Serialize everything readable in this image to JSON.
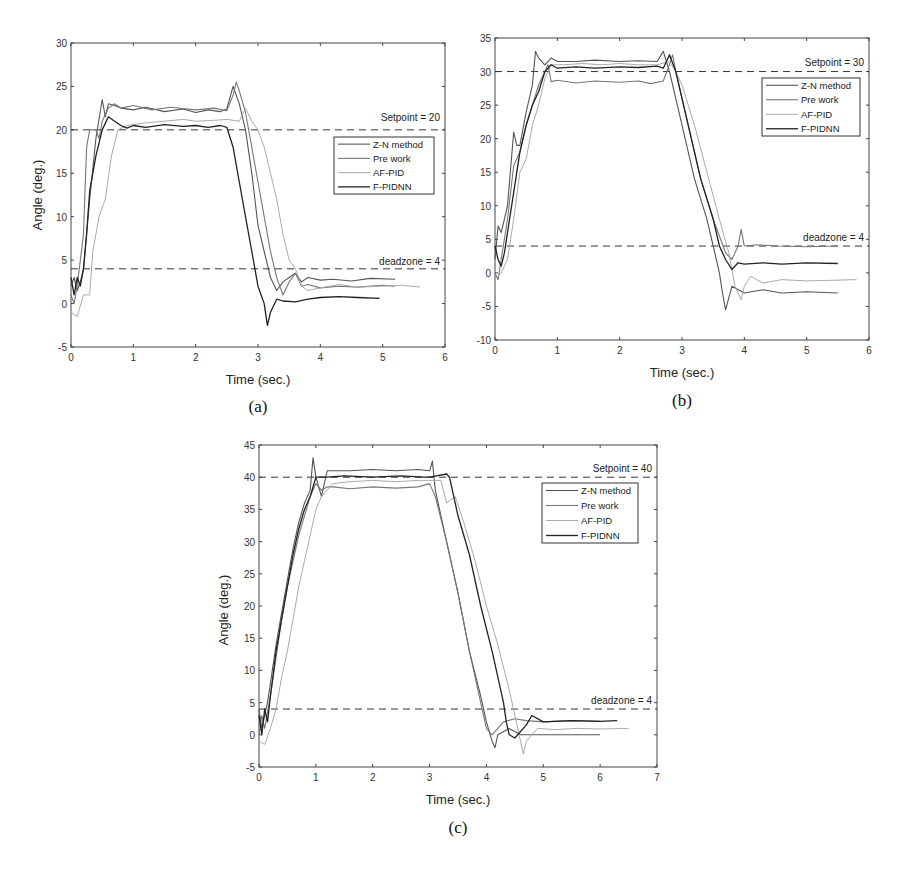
{
  "figure": {
    "panels": [
      "a",
      "b",
      "c"
    ]
  },
  "chart_data": [
    {
      "id": "a",
      "type": "line",
      "caption": "(a)",
      "xlabel": "Time (sec.)",
      "ylabel": "Angle (deg.)",
      "xlim": [
        0,
        6
      ],
      "ylim": [
        -5,
        30
      ],
      "xticks": [
        0,
        1,
        2,
        3,
        4,
        5,
        6
      ],
      "yticks": [
        -5,
        0,
        5,
        10,
        15,
        20,
        25,
        30
      ],
      "grid": false,
      "legend_position": "upper right (below setpoint line)",
      "annotations": [
        {
          "text": "Setpoint = 20",
          "y": 20,
          "style": "dashed"
        },
        {
          "text": "deadzone = 4",
          "y": 4,
          "style": "dashed"
        }
      ],
      "legend": [
        "Z-N method",
        "Pre work",
        "AF-PID",
        "F-PIDNN"
      ],
      "series": [
        {
          "name": "Z-N method",
          "color": "#555555",
          "width": 1.1,
          "x": [
            0,
            0.05,
            0.1,
            0.15,
            0.2,
            0.3,
            0.4,
            0.5,
            0.55,
            0.6,
            0.7,
            0.8,
            1.0,
            1.2,
            1.5,
            1.8,
            2.0,
            2.2,
            2.4,
            2.5,
            2.6,
            2.7,
            2.8,
            2.9,
            3.0,
            3.1,
            3.2,
            3.3,
            3.4,
            3.5,
            3.6,
            3.7,
            3.8,
            4.0,
            4.2,
            4.5,
            4.8,
            5.2
          ],
          "y": [
            2,
            3,
            1.5,
            2.5,
            4,
            12,
            19,
            23.5,
            21.5,
            23,
            22.8,
            22.5,
            22.3,
            22.6,
            22.1,
            22.4,
            22.0,
            22.3,
            22.1,
            22.4,
            25,
            23,
            20,
            15,
            9,
            6,
            3,
            1.5,
            2.5,
            3,
            3.5,
            2.5,
            3,
            2.7,
            2.8,
            2.6,
            2.9,
            2.8
          ]
        },
        {
          "name": "Pre work",
          "color": "#777777",
          "width": 1.1,
          "x": [
            0,
            0.05,
            0.1,
            0.2,
            0.25,
            0.3,
            0.4,
            0.45,
            0.5,
            0.6,
            0.7,
            0.8,
            1.0,
            1.3,
            1.6,
            2.0,
            2.3,
            2.5,
            2.6,
            2.65,
            2.7,
            2.8,
            2.9,
            3.0,
            3.1,
            3.2,
            3.3,
            3.4,
            3.5,
            3.6,
            3.7,
            3.8,
            4.0,
            4.3,
            4.6,
            5.0,
            5.2
          ],
          "y": [
            1,
            0,
            2,
            8,
            18,
            20,
            20,
            19,
            21,
            22.5,
            23,
            22.5,
            22.8,
            22.3,
            22.6,
            22.3,
            22.5,
            22.2,
            24,
            25.5,
            24.5,
            22,
            18,
            14,
            10,
            6,
            3,
            1,
            2.5,
            3.5,
            2,
            2.2,
            1.8,
            2.0,
            1.9,
            2.1,
            2.0
          ]
        },
        {
          "name": "AF-PID",
          "color": "#aaaaaa",
          "width": 1.0,
          "x": [
            0,
            0.1,
            0.2,
            0.3,
            0.35,
            0.45,
            0.55,
            0.65,
            0.75,
            0.9,
            1.2,
            1.5,
            1.8,
            2.0,
            2.3,
            2.5,
            2.7,
            2.8,
            2.9,
            3.0,
            3.1,
            3.2,
            3.3,
            3.4,
            3.5,
            3.6,
            3.7,
            3.8,
            4.0,
            4.3,
            4.6,
            5.0,
            5.3,
            5.6
          ],
          "y": [
            -1,
            -1.5,
            1,
            1,
            6,
            10,
            12,
            17,
            20,
            20.5,
            20.8,
            21,
            21.2,
            21,
            21.1,
            21.2,
            21,
            22.5,
            21,
            20,
            18,
            15,
            12,
            8,
            5,
            4,
            2,
            1.5,
            1.8,
            2.2,
            1.9,
            2.0,
            2.1,
            1.9
          ]
        },
        {
          "name": "F-PIDNN",
          "color": "#222222",
          "width": 1.3,
          "x": [
            0,
            0.05,
            0.1,
            0.15,
            0.2,
            0.25,
            0.3,
            0.4,
            0.5,
            0.6,
            0.7,
            0.8,
            0.9,
            1.0,
            1.2,
            1.5,
            1.8,
            2.0,
            2.2,
            2.4,
            2.5,
            2.6,
            2.7,
            2.8,
            2.9,
            3.0,
            3.1,
            3.15,
            3.2,
            3.3,
            3.4,
            3.6,
            3.8,
            4.0,
            4.3,
            4.6,
            4.95
          ],
          "y": [
            3,
            1,
            3,
            2,
            4,
            8,
            13,
            17,
            20,
            21.5,
            21,
            20.5,
            20.2,
            20.5,
            20.3,
            20.6,
            20.4,
            20.5,
            20.3,
            20.5,
            20.3,
            18,
            14,
            10,
            6,
            2,
            0,
            -2.5,
            -1,
            0.5,
            0.3,
            0.2,
            0.5,
            0.7,
            0.8,
            0.7,
            0.6
          ]
        }
      ]
    },
    {
      "id": "b",
      "type": "line",
      "caption": "(b)",
      "xlabel": "Time (sec.)",
      "ylabel": "",
      "xlim": [
        0,
        6
      ],
      "ylim": [
        -10,
        35
      ],
      "xticks": [
        0,
        1,
        2,
        3,
        4,
        5,
        6
      ],
      "yticks": [
        -10,
        -5,
        0,
        5,
        10,
        15,
        20,
        25,
        30,
        35
      ],
      "grid": false,
      "legend_position": "upper right (below setpoint line)",
      "annotations": [
        {
          "text": "Setpoint = 30",
          "y": 30,
          "style": "dashed"
        },
        {
          "text": "deadzone = 4",
          "y": 4,
          "style": "dashed"
        }
      ],
      "legend": [
        "Z-N method",
        "Pre work",
        "AF-PID",
        "F-PIDNN"
      ],
      "series": [
        {
          "name": "Z-N method",
          "color": "#555555",
          "width": 1.1,
          "x": [
            0,
            0.05,
            0.1,
            0.15,
            0.2,
            0.3,
            0.35,
            0.4,
            0.5,
            0.6,
            0.65,
            0.7,
            0.8,
            0.9,
            1.0,
            1.3,
            1.6,
            2.0,
            2.3,
            2.6,
            2.7,
            2.75,
            2.8,
            3.0,
            3.2,
            3.4,
            3.5,
            3.6,
            3.65,
            3.7,
            3.8,
            4.0,
            4.3,
            4.6,
            5.0,
            5.5
          ],
          "y": [
            2,
            7,
            6,
            8,
            10,
            21,
            19,
            19,
            24,
            28,
            33,
            32,
            31,
            32,
            31.5,
            31.5,
            31.7,
            31.5,
            31.6,
            31.5,
            33,
            31.5,
            30,
            22,
            14,
            8,
            4,
            0,
            -3,
            -5.5,
            -2,
            -3,
            -2.5,
            -3,
            -2.8,
            -3
          ]
        },
        {
          "name": "Pre work",
          "color": "#777777",
          "width": 1.1,
          "x": [
            0,
            0.05,
            0.1,
            0.2,
            0.3,
            0.4,
            0.5,
            0.6,
            0.7,
            0.8,
            0.85,
            0.9,
            1.0,
            1.3,
            1.6,
            2.0,
            2.3,
            2.5,
            2.7,
            2.8,
            2.85,
            2.9,
            3.1,
            3.3,
            3.5,
            3.7,
            3.8,
            3.9,
            3.95,
            4.0,
            4.2,
            4.5,
            5.0,
            5.5
          ],
          "y": [
            0,
            -1,
            2,
            8,
            16,
            18,
            22,
            25,
            28,
            30,
            31,
            28.5,
            28.7,
            28.3,
            28.6,
            28.4,
            28.6,
            28.2,
            28.6,
            31,
            32.5,
            30,
            22,
            14,
            8,
            3,
            2,
            4,
            6.5,
            4,
            4.2,
            4,
            3.9,
            4
          ]
        },
        {
          "name": "AF-PID",
          "color": "#aaaaaa",
          "width": 1.0,
          "x": [
            0,
            0.1,
            0.2,
            0.3,
            0.4,
            0.5,
            0.6,
            0.7,
            0.8,
            0.9,
            1.1,
            1.4,
            1.7,
            2.0,
            2.3,
            2.6,
            2.8,
            2.9,
            3.0,
            3.2,
            3.4,
            3.6,
            3.75,
            3.85,
            3.95,
            4.0,
            4.1,
            4.3,
            4.6,
            5.0,
            5.4,
            5.8
          ],
          "y": [
            -1,
            0,
            2,
            8,
            15,
            17,
            22,
            25,
            29,
            31,
            31,
            31.2,
            31,
            31.2,
            31,
            31,
            31.5,
            30,
            28,
            22,
            15,
            8,
            3,
            -2,
            -4,
            -2,
            -0.5,
            -1.5,
            -1,
            -1.2,
            -1.1,
            -1
          ]
        },
        {
          "name": "F-PIDNN",
          "color": "#222222",
          "width": 1.3,
          "x": [
            0,
            0.05,
            0.1,
            0.15,
            0.2,
            0.3,
            0.4,
            0.5,
            0.6,
            0.7,
            0.8,
            0.9,
            1.0,
            1.3,
            1.6,
            2.0,
            2.3,
            2.6,
            2.7,
            2.8,
            2.9,
            3.1,
            3.3,
            3.5,
            3.6,
            3.7,
            3.8,
            3.9,
            4.0,
            4.3,
            4.6,
            5.0,
            5.5
          ],
          "y": [
            4,
            2,
            1,
            3,
            6,
            12,
            18,
            22,
            25,
            27,
            30,
            31,
            30.5,
            30.7,
            30.5,
            30.7,
            30.6,
            30.8,
            30.5,
            32.5,
            30,
            22,
            14,
            8,
            4,
            2,
            0.5,
            1.5,
            1.3,
            1.5,
            1.3,
            1.5,
            1.4
          ]
        }
      ]
    },
    {
      "id": "c",
      "type": "line",
      "caption": "(c)",
      "xlabel": "Time (sec.)",
      "ylabel": "Angle (deg.)",
      "xlim": [
        0,
        7
      ],
      "ylim": [
        -5,
        45
      ],
      "xticks": [
        0,
        1,
        2,
        3,
        4,
        5,
        6,
        7
      ],
      "yticks": [
        -5,
        0,
        5,
        10,
        15,
        20,
        25,
        30,
        35,
        40,
        45
      ],
      "grid": false,
      "legend_position": "upper right (below setpoint line)",
      "annotations": [
        {
          "text": "Setpoint = 40",
          "y": 40,
          "style": "dashed"
        },
        {
          "text": "deadzone = 4",
          "y": 4,
          "style": "dashed"
        }
      ],
      "legend": [
        "Z-N method",
        "Pre work",
        "AF-PID",
        "F-PIDNN"
      ],
      "series": [
        {
          "name": "Z-N method",
          "color": "#555555",
          "width": 1.1,
          "x": [
            0,
            0.05,
            0.1,
            0.15,
            0.2,
            0.3,
            0.4,
            0.5,
            0.6,
            0.7,
            0.8,
            0.9,
            0.95,
            1.0,
            1.1,
            1.2,
            1.3,
            1.6,
            2.0,
            2.4,
            2.8,
            3.0,
            3.05,
            3.1,
            3.3,
            3.5,
            3.7,
            3.9,
            4.0,
            4.1,
            4.15,
            4.2,
            4.4,
            4.6,
            4.8,
            5.0,
            5.5,
            6.0
          ],
          "y": [
            4,
            1,
            3,
            5,
            8,
            14,
            19,
            24,
            29,
            33,
            36,
            38,
            43,
            40,
            37,
            41,
            41,
            41,
            41.2,
            41,
            41.2,
            41,
            42.5,
            38,
            30,
            22,
            13,
            6,
            2,
            -1,
            -2,
            0,
            1,
            0,
            0,
            0,
            0,
            0
          ]
        },
        {
          "name": "Pre work",
          "color": "#777777",
          "width": 1.1,
          "x": [
            0,
            0.05,
            0.1,
            0.2,
            0.3,
            0.4,
            0.5,
            0.6,
            0.7,
            0.8,
            0.9,
            1.0,
            1.1,
            1.2,
            1.3,
            1.6,
            2.0,
            2.4,
            2.8,
            3.0,
            3.1,
            3.3,
            3.5,
            3.7,
            3.9,
            4.0,
            4.1,
            4.3,
            4.5,
            4.7,
            5.0,
            5.5,
            6.0
          ],
          "y": [
            0,
            3,
            1,
            6,
            12,
            18,
            23,
            27,
            31,
            34,
            37,
            39,
            38,
            38.5,
            38.5,
            38.2,
            38.5,
            38.3,
            38.5,
            39,
            37,
            30,
            22,
            13,
            5,
            1,
            0,
            2,
            2.5,
            2.2,
            2,
            2.2,
            2.1
          ]
        },
        {
          "name": "AF-PID",
          "color": "#aaaaaa",
          "width": 1.0,
          "x": [
            0,
            0.1,
            0.2,
            0.3,
            0.4,
            0.5,
            0.6,
            0.7,
            0.8,
            0.9,
            1.0,
            1.1,
            1.3,
            1.6,
            2.0,
            2.4,
            2.8,
            3.2,
            3.3,
            3.45,
            3.6,
            3.8,
            4.0,
            4.2,
            4.4,
            4.5,
            4.6,
            4.65,
            4.7,
            4.9,
            5.2,
            5.6,
            6.0,
            6.5
          ],
          "y": [
            -1,
            -1.5,
            1,
            4,
            9,
            13,
            18,
            23,
            27,
            31,
            35,
            37,
            39,
            39.3,
            39.5,
            39.3,
            39.5,
            39.5,
            36,
            37,
            33,
            27,
            20,
            14,
            7,
            3,
            -1,
            -3,
            -1,
            1,
            0.8,
            1,
            0.9,
            1
          ]
        },
        {
          "name": "F-PIDNN",
          "color": "#222222",
          "width": 1.3,
          "x": [
            0,
            0.05,
            0.1,
            0.15,
            0.2,
            0.3,
            0.4,
            0.5,
            0.6,
            0.7,
            0.8,
            0.9,
            1.0,
            1.2,
            1.5,
            2.0,
            2.5,
            2.9,
            3.0,
            3.3,
            3.35,
            3.5,
            3.7,
            3.9,
            4.1,
            4.3,
            4.35,
            4.4,
            4.5,
            4.7,
            4.8,
            5.0,
            5.5,
            6.0,
            6.3
          ],
          "y": [
            3,
            0,
            4,
            2,
            6,
            13,
            18,
            23,
            28,
            32,
            35,
            37,
            40,
            40,
            40.2,
            40,
            40.2,
            40,
            40,
            40.5,
            40,
            34,
            28,
            20,
            13,
            5,
            2,
            0,
            -0.5,
            1.5,
            3,
            2,
            2.2,
            2.1,
            2.2
          ]
        }
      ]
    }
  ],
  "panels": {
    "a": {
      "caption": "(a)",
      "xlabel": "Time (sec.)",
      "ylabel": "Angle (deg.)",
      "setpoint_label": "Setpoint = 20",
      "deadzone_label": "deadzone = 4"
    },
    "b": {
      "caption": "(b)",
      "xlabel": "Time (sec.)",
      "ylabel": "",
      "setpoint_label": "Setpoint = 30",
      "deadzone_label": "deadzone = 4"
    },
    "c": {
      "caption": "(c)",
      "xlabel": "Time (sec.)",
      "ylabel": "Angle (deg.)",
      "setpoint_label": "Setpoint = 40",
      "deadzone_label": "deadzone = 4"
    }
  },
  "legend": {
    "items": [
      "Z-N method",
      "Pre work",
      "AF-PID",
      "F-PIDNN"
    ]
  }
}
